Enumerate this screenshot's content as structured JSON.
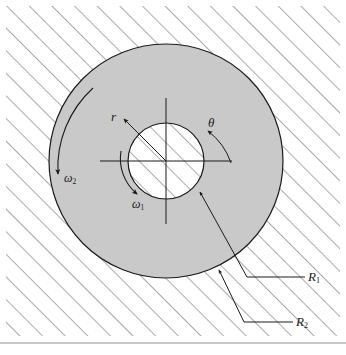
{
  "figure": {
    "background_color": "#ffffff",
    "annulus_fill": "#c9c9c9",
    "inner_fill": "#ffffff",
    "line_color": "#1a1a1a",
    "hatch_color": "#555555"
  },
  "geometry": {
    "center_x": 166,
    "center_y": 161,
    "outer_radius": 117,
    "inner_radius": 38,
    "axis_half_length_x": 66,
    "axis_half_length_y": 63
  },
  "labels": {
    "radial_coordinate": "r",
    "angular_coordinate": "θ",
    "inner_angular_velocity": "ω",
    "inner_angular_velocity_sub": "1",
    "outer_angular_velocity": "ω",
    "outer_angular_velocity_sub": "2",
    "inner_radius_label": "R",
    "inner_radius_sub": "1",
    "outer_radius_label": "R",
    "outer_radius_sub": "2"
  },
  "annotations": {
    "hatching": "45-degree hatch lines filling the region outside the outer circle",
    "omega1_arrow": "counterclockwise arc arrow around the inner circle",
    "omega2_arrow": "counterclockwise arc arrow along the inside of the outer circle",
    "r_arrow": "straight arrow from center pointing up-left",
    "theta_arrow": "curved arrow from the positive x-axis sweeping counterclockwise",
    "R1_leader": "leader line from the inner circle boundary to the R1 label",
    "R2_leader": "leader line from the outer circle boundary to the R2 label"
  }
}
